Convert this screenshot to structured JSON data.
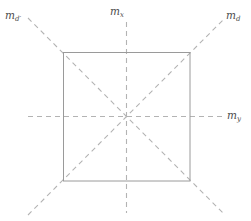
{
  "figure": {
    "type": "geometric-axes-diagram",
    "background_color": "#ffffff",
    "square": {
      "name": "square-outline",
      "stroke_color": "#999999",
      "stroke_width": 1,
      "style": "solid",
      "x1": 63,
      "y1": 52,
      "x2": 190,
      "y2": 181,
      "center_x": 126.5,
      "center_y": 116.5,
      "width": 127,
      "height": 129
    },
    "lines": [
      {
        "name": "axis-mx-vertical",
        "style": "dashed",
        "stroke_color": "#b3b3b3",
        "x1": 126.5,
        "y1": 22,
        "x2": 126.5,
        "y2": 213
      },
      {
        "name": "axis-my-horizontal",
        "style": "dashed",
        "stroke_color": "#b3b3b3",
        "x1": 28,
        "y1": 116.5,
        "x2": 222,
        "y2": 116.5
      },
      {
        "name": "axis-md-diagonal",
        "style": "dashed",
        "stroke_color": "#b3b3b3",
        "x1": 28,
        "y1": 215,
        "x2": 225,
        "y2": 18
      },
      {
        "name": "axis-mdprime-diagonal",
        "style": "dashed",
        "stroke_color": "#b3b3b3",
        "x1": 28,
        "y1": 18,
        "x2": 225,
        "y2": 215
      }
    ],
    "labels": {
      "top_left": {
        "base": "m",
        "sub": "d",
        "prime": "′"
      },
      "top_center": {
        "base": "m",
        "sub": "x",
        "prime": ""
      },
      "top_right": {
        "base": "m",
        "sub": "d",
        "prime": ""
      },
      "right": {
        "base": "m",
        "sub": "y",
        "prime": ""
      }
    },
    "label_color": "#4d4d4d"
  }
}
